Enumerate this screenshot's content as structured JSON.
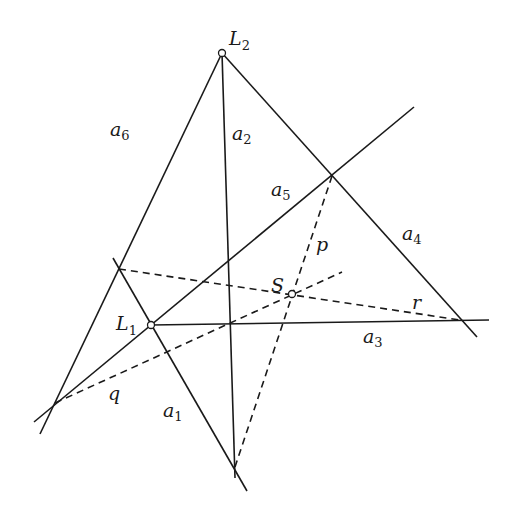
{
  "figure": {
    "type": "geometric-construction",
    "points": {
      "L1": {
        "label": "L",
        "sub": "1",
        "x": 151,
        "y": 325
      },
      "L2": {
        "label": "L",
        "sub": "2",
        "x": 222,
        "y": 53
      },
      "S": {
        "label": "S",
        "sub": "",
        "x": 292,
        "y": 294
      }
    },
    "lines": {
      "a1": {
        "label": "a",
        "sub": "1",
        "style": "solid"
      },
      "a2": {
        "label": "a",
        "sub": "2",
        "style": "solid"
      },
      "a3": {
        "label": "a",
        "sub": "3",
        "style": "solid"
      },
      "a4": {
        "label": "a",
        "sub": "4",
        "style": "solid"
      },
      "a5": {
        "label": "a",
        "sub": "5",
        "style": "solid"
      },
      "a6": {
        "label": "a",
        "sub": "6",
        "style": "solid"
      },
      "p": {
        "label": "p",
        "style": "dashed"
      },
      "q": {
        "label": "q",
        "style": "dashed"
      },
      "r": {
        "label": "r",
        "style": "dashed"
      }
    }
  }
}
